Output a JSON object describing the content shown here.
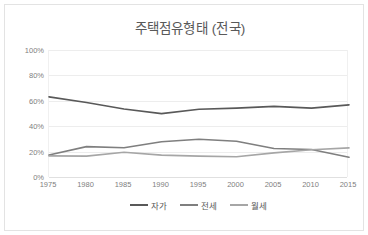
{
  "chart": {
    "title": "주택점유형태 (전국)"
  },
  "legend": {
    "position": "bottom-center",
    "items": [
      {
        "label": "자가",
        "color": "#595959",
        "icon": "line-swatch"
      },
      {
        "label": "전세",
        "color": "#7f7f7f",
        "icon": "line-swatch"
      },
      {
        "label": "월세",
        "color": "#a6a6a6",
        "icon": "line-swatch"
      }
    ]
  },
  "yaxis": {
    "ticks": [
      "0%",
      "20%",
      "40%",
      "60%",
      "80%",
      "100%"
    ],
    "values": [
      0,
      20,
      40,
      60,
      80,
      100
    ]
  },
  "xaxis": {
    "ticks": [
      "1975",
      "1980",
      "1985",
      "1990",
      "1995",
      "2000",
      "2005",
      "2010",
      "2015"
    ]
  },
  "chart_data": {
    "type": "line",
    "title": "주택점유형태 (전국)",
    "xlabel": "",
    "ylabel": "",
    "categories": [
      "1975",
      "1980",
      "1985",
      "1990",
      "1995",
      "2000",
      "2005",
      "2010",
      "2015"
    ],
    "series": [
      {
        "name": "자가",
        "color": "#595959",
        "values": [
          63.1,
          58.6,
          53.6,
          49.9,
          53.3,
          54.2,
          55.6,
          54.2,
          56.8
        ]
      },
      {
        "name": "전세",
        "color": "#7f7f7f",
        "values": [
          17.3,
          23.9,
          23.0,
          27.8,
          29.7,
          28.2,
          22.4,
          21.7,
          15.5
        ]
      },
      {
        "name": "월세",
        "color": "#a6a6a6",
        "values": [
          16.6,
          16.4,
          19.5,
          17.2,
          16.4,
          16.0,
          19.0,
          21.4,
          22.9
        ]
      }
    ],
    "ylim": [
      0,
      100
    ],
    "ytick_interval": 20,
    "grid": true,
    "legend_position": "bottom-center"
  }
}
